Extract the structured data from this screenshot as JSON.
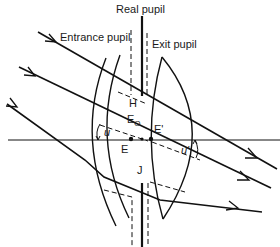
{
  "diagram": {
    "title": "",
    "labels": {
      "real_pupil": "Real pupil",
      "entrance_pupil": "Entrance pupil",
      "exit_pupil": "Exit pupil",
      "point_H": "H",
      "point_E0_main": "E",
      "point_E0_sub": "O",
      "point_E": "E",
      "point_E_prime": "E'",
      "point_J": "J",
      "angle_u": "u",
      "angle_u_prime": "u'"
    },
    "colors": {
      "stroke": "#111111",
      "background": "#ffffff"
    },
    "elements": {
      "optical_axis": "horizontal axis",
      "rays": [
        "top ray",
        "middle ray",
        "bottom ray"
      ],
      "lenses": [
        "meniscus lens (left)",
        "convex lens (right)"
      ],
      "stops": [
        "real pupil aperture",
        "entrance pupil image",
        "exit pupil image"
      ]
    }
  }
}
